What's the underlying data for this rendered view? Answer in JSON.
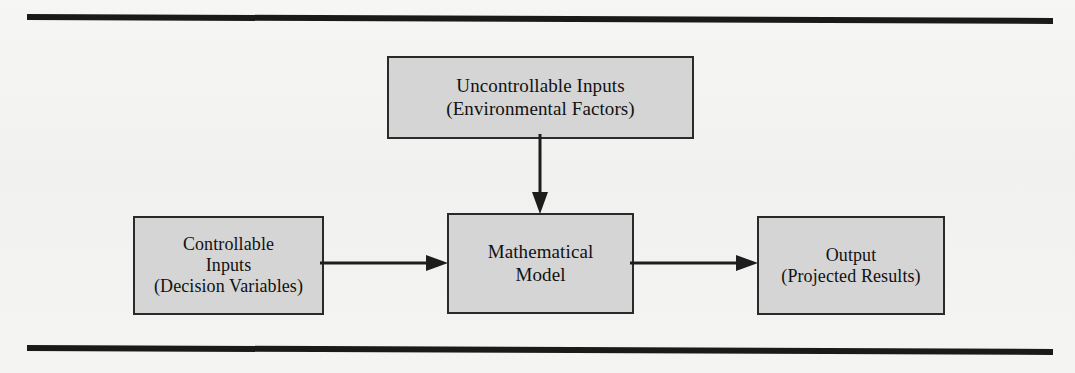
{
  "figure": {
    "background_color": "#f3f3f1",
    "node_fill_color": "#d5d5d5",
    "node_border_color": "#2a2a2a",
    "rule_color": "#1a1a1a"
  },
  "nodes": {
    "uncontrollable": {
      "name": "Uncontrollable Inputs",
      "line1": "Uncontrollable Inputs",
      "line2": "(Environmental Factors)"
    },
    "controllable": {
      "name": "Controllable Inputs",
      "line1": "Controllable",
      "line2": "Inputs",
      "line3": "(Decision Variables)"
    },
    "model": {
      "name": "Mathematical Model",
      "line1": "Mathematical",
      "line2": "Model"
    },
    "output": {
      "name": "Output",
      "line1": "Output",
      "line2": "(Projected Results)"
    }
  },
  "connectors": [
    {
      "id": "uncontrollable-to-model",
      "icon": "arrow-down-icon",
      "from": "uncontrollable",
      "to": "model",
      "direction": "down"
    },
    {
      "id": "controllable-to-model",
      "icon": "arrow-right-icon",
      "from": "controllable",
      "to": "model",
      "direction": "right"
    },
    {
      "id": "model-to-output",
      "icon": "arrow-right-icon",
      "from": "model",
      "to": "output",
      "direction": "right"
    }
  ],
  "rules": {
    "top_label": "top horizontal rule",
    "bottom_label": "bottom horizontal rule"
  }
}
